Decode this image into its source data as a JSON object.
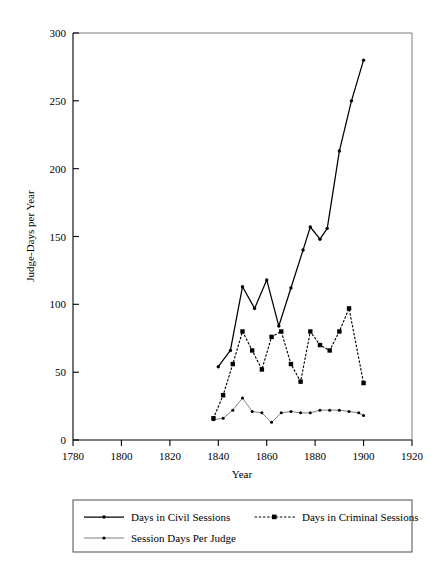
{
  "chart_data": {
    "type": "line",
    "title": "",
    "xlabel": "Year",
    "ylabel": "Judge-Days per Year",
    "xlim": [
      1780,
      1920
    ],
    "ylim": [
      0,
      300
    ],
    "xticks": [
      1780,
      1800,
      1820,
      1840,
      1860,
      1880,
      1900,
      1920
    ],
    "yticks": [
      0,
      50,
      100,
      150,
      200,
      250,
      300
    ],
    "grid": false,
    "legend_position": "below",
    "series": [
      {
        "name": "Days in Civil Sessions",
        "style": "solid",
        "marker": "dot",
        "x": [
          1840,
          1845,
          1850,
          1855,
          1860,
          1865,
          1870,
          1875,
          1878,
          1882,
          1885,
          1890,
          1895,
          1900
        ],
        "values": [
          54,
          66,
          113,
          97,
          118,
          84,
          112,
          140,
          157,
          148,
          156,
          213,
          250,
          280
        ]
      },
      {
        "name": "Days in Criminal Sessions",
        "style": "dotted",
        "marker": "square",
        "x": [
          1838,
          1842,
          1846,
          1850,
          1854,
          1858,
          1862,
          1866,
          1870,
          1874,
          1878,
          1882,
          1886,
          1890,
          1894,
          1900
        ],
        "values": [
          16,
          33,
          56,
          80,
          66,
          52,
          76,
          80,
          56,
          43,
          80,
          70,
          66,
          80,
          97,
          42
        ]
      },
      {
        "name": "Session Days Per Judge",
        "style": "solid-thin",
        "marker": "dot",
        "x": [
          1838,
          1842,
          1846,
          1850,
          1854,
          1858,
          1862,
          1866,
          1870,
          1874,
          1878,
          1882,
          1886,
          1890,
          1894,
          1898,
          1900
        ],
        "values": [
          15,
          16,
          22,
          31,
          21,
          20,
          13,
          20,
          21,
          20,
          20,
          22,
          22,
          22,
          21,
          20,
          18
        ]
      }
    ]
  },
  "axis": {
    "x_tick_labels": [
      "1780",
      "1800",
      "1820",
      "1840",
      "1860",
      "1880",
      "1900",
      "1920"
    ],
    "y_tick_labels": [
      "0",
      "50",
      "100",
      "150",
      "200",
      "250",
      "300"
    ],
    "x_title": "Year",
    "y_title": "Judge-Days per Year"
  },
  "legend": {
    "entries": [
      {
        "label": "Days in Civil Sessions",
        "style": "solid"
      },
      {
        "label": "Days in Criminal Sessions",
        "style": "dotted"
      },
      {
        "label": "Session Days Per Judge",
        "style": "solid-thin"
      }
    ]
  },
  "colors": {
    "ink": "#000000",
    "frame": "#6e6e6e",
    "thin_line": "#707070",
    "background": "#ffffff"
  }
}
